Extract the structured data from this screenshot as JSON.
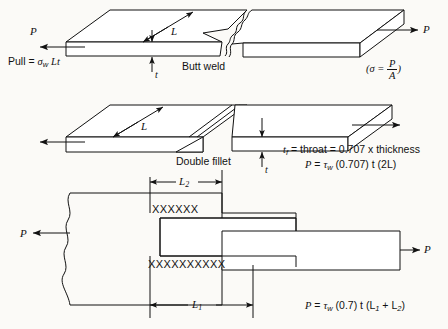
{
  "figure": {
    "background_color": "#fbfaf7",
    "line_color": "#111111",
    "width": 448,
    "height": 329
  },
  "diagram_butt": {
    "name": "Butt weld joint",
    "caption": "Butt weld",
    "force_left_label": "P",
    "force_right_label": "P",
    "length_label": "L",
    "thickness_label": "t",
    "pull_formula": {
      "lhs": "Pull",
      "equals": "=",
      "stress_symbol": "σ",
      "stress_subscript": "w",
      "terms": "Lt",
      "full_text": "Pull = σw Lt"
    },
    "stress_note": {
      "open_paren": "(",
      "symbol": "σ",
      "equals": "=",
      "numerator": "P",
      "denominator": "A",
      "close_paren": ")",
      "full_text": "(σ = P/A)"
    }
  },
  "diagram_fillet": {
    "name": "Double fillet weld joint",
    "caption": "Double fillet",
    "length_label": "L",
    "thickness_label": "t",
    "throat_formula": {
      "symbol": "t",
      "subscript": "f",
      "full_text": "tf = throat = 0.707 x thickness",
      "body": "= throat = 0.707 x thickness"
    },
    "load_formula": {
      "lhs": "P",
      "equals": "=",
      "tau_symbol": "τ",
      "tau_subscript": "w",
      "terms": "(0.707) t (2L)",
      "full_text": "P = τw (0.707) t (2L)"
    }
  },
  "diagram_lap": {
    "name": "Lap joint with transverse and longitudinal fillet welds",
    "force_left_label": "P",
    "force_right_label": "P",
    "dimension_top_label": "L",
    "dimension_top_subscript": "2",
    "dimension_bottom_label": "L",
    "dimension_bottom_subscript": "1",
    "weld_row_top": "XXXXXX",
    "weld_row_bottom": "XXXXXXXXXX",
    "load_formula": {
      "lhs": "P",
      "equals": "=",
      "tau_symbol": "τ",
      "tau_subscript": "w",
      "terms_before": "(0.7) t (L",
      "sub_one": "1",
      "plus": " + L",
      "sub_two": "2",
      "terms_after": ")",
      "full_text": "P = τw (0.7) t (L1 + L2)"
    }
  }
}
